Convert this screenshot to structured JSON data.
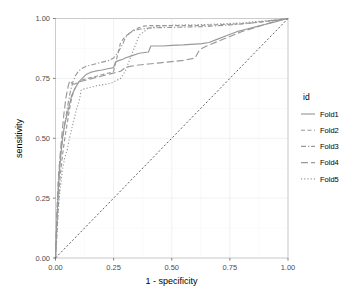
{
  "chart_data": {
    "type": "line",
    "title": "",
    "xlabel": "1 - specificity",
    "ylabel": "sensitivity",
    "xlim": [
      0,
      1
    ],
    "ylim": [
      0,
      1
    ],
    "xticks": [
      "0.00",
      "0.25",
      "0.50",
      "0.75",
      "1.00"
    ],
    "xtick_values": [
      0,
      0.25,
      0.5,
      0.75,
      1
    ],
    "yticks": [
      "0.00",
      "0.25",
      "0.50",
      "0.75",
      "1.00"
    ],
    "ytick_values": [
      0,
      0.25,
      0.5,
      0.75,
      1
    ],
    "grid": true,
    "legend_position": "right",
    "legend_title": "id",
    "line_color": "#999999",
    "reference_line": {
      "name": "chance-diagonal",
      "x": [
        0,
        1
      ],
      "y": [
        0,
        1
      ],
      "style": "dotted",
      "color": "#2b2b2b"
    },
    "series": [
      {
        "name": "Fold1",
        "style": "solid",
        "dasharray": "",
        "x": [
          0,
          0.004,
          0.008,
          0.012,
          0.016,
          0.02,
          0.025,
          0.03,
          0.04,
          0.05,
          0.06,
          0.07,
          0.085,
          0.1,
          0.115,
          0.13,
          0.15,
          0.17,
          0.2,
          0.225,
          0.25,
          0.255,
          0.26,
          0.275,
          0.29,
          0.3,
          0.33,
          0.36,
          0.4,
          0.41,
          0.42,
          0.46,
          0.5,
          0.55,
          0.58,
          0.6,
          0.63,
          0.66,
          0.7,
          0.74,
          0.78,
          0.82,
          0.86,
          0.9,
          0.94,
          0.97,
          1
        ],
        "y": [
          0,
          0.1,
          0.2,
          0.28,
          0.35,
          0.4,
          0.45,
          0.5,
          0.56,
          0.6,
          0.64,
          0.68,
          0.71,
          0.735,
          0.75,
          0.765,
          0.775,
          0.78,
          0.785,
          0.79,
          0.795,
          0.81,
          0.82,
          0.825,
          0.83,
          0.835,
          0.845,
          0.855,
          0.86,
          0.885,
          0.885,
          0.885,
          0.888,
          0.89,
          0.892,
          0.893,
          0.895,
          0.9,
          0.915,
          0.93,
          0.945,
          0.955,
          0.965,
          0.975,
          0.985,
          0.993,
          1
        ]
      },
      {
        "name": "Fold2",
        "style": "dashed",
        "dasharray": "4,2.5",
        "x": [
          0,
          0.005,
          0.01,
          0.015,
          0.02,
          0.03,
          0.04,
          0.05,
          0.06,
          0.07,
          0.08,
          0.09,
          0.1,
          0.12,
          0.14,
          0.16,
          0.18,
          0.2,
          0.22,
          0.24,
          0.25,
          0.26,
          0.27,
          0.28,
          0.3,
          0.32,
          0.34,
          0.36,
          0.38,
          0.4,
          0.45,
          0.5,
          0.55,
          0.6,
          0.65,
          0.7,
          0.75,
          0.8,
          0.85,
          0.9,
          0.95,
          1
        ],
        "y": [
          0,
          0.08,
          0.18,
          0.27,
          0.34,
          0.43,
          0.5,
          0.56,
          0.62,
          0.67,
          0.7,
          0.72,
          0.735,
          0.745,
          0.75,
          0.755,
          0.76,
          0.765,
          0.77,
          0.775,
          0.78,
          0.82,
          0.86,
          0.9,
          0.925,
          0.94,
          0.955,
          0.962,
          0.968,
          0.97,
          0.97,
          0.97,
          0.97,
          0.97,
          0.972,
          0.974,
          0.976,
          0.978,
          0.982,
          0.987,
          0.993,
          1
        ]
      },
      {
        "name": "Fold3",
        "style": "dashdot",
        "dasharray": "5,2,1.2,2",
        "x": [
          0,
          0.004,
          0.008,
          0.012,
          0.018,
          0.025,
          0.035,
          0.045,
          0.055,
          0.065,
          0.075,
          0.085,
          0.095,
          0.11,
          0.13,
          0.15,
          0.17,
          0.19,
          0.21,
          0.23,
          0.25,
          0.27,
          0.29,
          0.3,
          0.32,
          0.34,
          0.36,
          0.4,
          0.45,
          0.5,
          0.55,
          0.6,
          0.65,
          0.7,
          0.75,
          0.8,
          0.85,
          0.9,
          0.95,
          1
        ],
        "y": [
          0,
          0.12,
          0.24,
          0.33,
          0.4,
          0.46,
          0.53,
          0.59,
          0.65,
          0.7,
          0.735,
          0.76,
          0.775,
          0.79,
          0.8,
          0.805,
          0.81,
          0.815,
          0.82,
          0.825,
          0.835,
          0.86,
          0.895,
          0.92,
          0.94,
          0.95,
          0.955,
          0.96,
          0.962,
          0.963,
          0.964,
          0.965,
          0.967,
          0.97,
          0.973,
          0.977,
          0.982,
          0.988,
          0.994,
          1
        ]
      },
      {
        "name": "Fold4",
        "style": "longdash",
        "dasharray": "7,3",
        "x": [
          0,
          0.004,
          0.01,
          0.015,
          0.02,
          0.028,
          0.036,
          0.045,
          0.055,
          0.06,
          0.065,
          0.07,
          0.08,
          0.09,
          0.1,
          0.12,
          0.14,
          0.16,
          0.18,
          0.2,
          0.22,
          0.24,
          0.26,
          0.28,
          0.3,
          0.32,
          0.35,
          0.4,
          0.45,
          0.5,
          0.55,
          0.6,
          0.62,
          0.65,
          0.7,
          0.75,
          0.8,
          0.85,
          0.9,
          0.95,
          1
        ],
        "y": [
          0,
          0.13,
          0.26,
          0.36,
          0.43,
          0.52,
          0.6,
          0.67,
          0.72,
          0.735,
          0.74,
          0.73,
          0.725,
          0.73,
          0.735,
          0.74,
          0.745,
          0.75,
          0.755,
          0.76,
          0.765,
          0.77,
          0.775,
          0.78,
          0.795,
          0.8,
          0.805,
          0.81,
          0.815,
          0.82,
          0.825,
          0.835,
          0.87,
          0.885,
          0.905,
          0.925,
          0.945,
          0.96,
          0.975,
          0.99,
          1
        ]
      },
      {
        "name": "Fold5",
        "style": "dotted",
        "dasharray": "1.2,2",
        "x": [
          0,
          0.004,
          0.008,
          0.012,
          0.018,
          0.025,
          0.03,
          0.04,
          0.05,
          0.06,
          0.07,
          0.08,
          0.09,
          0.1,
          0.105,
          0.11,
          0.12,
          0.14,
          0.16,
          0.18,
          0.2,
          0.22,
          0.24,
          0.25,
          0.26,
          0.27,
          0.28,
          0.3,
          0.32,
          0.34,
          0.36,
          0.4,
          0.45,
          0.5,
          0.55,
          0.6,
          0.65,
          0.7,
          0.75,
          0.8,
          0.85,
          0.9,
          0.95,
          1
        ],
        "y": [
          0,
          0.06,
          0.13,
          0.2,
          0.27,
          0.33,
          0.37,
          0.42,
          0.45,
          0.5,
          0.54,
          0.58,
          0.62,
          0.65,
          0.67,
          0.7,
          0.705,
          0.71,
          0.715,
          0.72,
          0.723,
          0.726,
          0.73,
          0.735,
          0.74,
          0.745,
          0.75,
          0.78,
          0.83,
          0.88,
          0.93,
          0.96,
          0.968,
          0.972,
          0.973,
          0.974,
          0.975,
          0.977,
          0.979,
          0.982,
          0.986,
          0.99,
          0.995,
          1
        ]
      }
    ]
  },
  "legend": {
    "title": "id",
    "items": [
      {
        "label": "Fold1",
        "style": "solid"
      },
      {
        "label": "Fold2",
        "style": "dashed"
      },
      {
        "label": "Fold3",
        "style": "dashdot"
      },
      {
        "label": "Fold4",
        "style": "longdash"
      },
      {
        "label": "Fold5",
        "style": "dotted"
      }
    ]
  }
}
